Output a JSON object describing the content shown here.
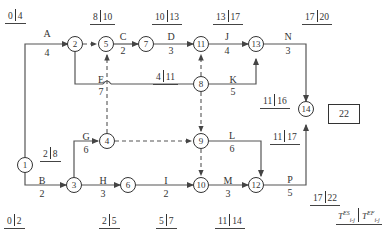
{
  "diagram": {
    "type": "activity-on-arrow network",
    "total_duration": "22",
    "legend": {
      "es": "T",
      "es_sup": "ES",
      "es_sub": "i-j",
      "ef": "T",
      "ef_sup": "EF",
      "ef_sub": "i-j"
    },
    "nodes": [
      "1",
      "2",
      "3",
      "4",
      "5",
      "6",
      "7",
      "8",
      "9",
      "10",
      "11",
      "12",
      "13",
      "14"
    ],
    "activities": [
      {
        "name": "A",
        "duration": "4",
        "from": "1",
        "to": "2",
        "es": "0",
        "ef": "4"
      },
      {
        "name": "B",
        "duration": "2",
        "from": "1",
        "to": "3",
        "es": "0",
        "ef": "2"
      },
      {
        "name": "C",
        "duration": "2",
        "from": "5",
        "to": "7",
        "es": "8",
        "ef": "10"
      },
      {
        "name": "D",
        "duration": "3",
        "from": "7",
        "to": "11",
        "es": "10",
        "ef": "13"
      },
      {
        "name": "E",
        "duration": "7",
        "from": "2",
        "to": "8",
        "es": "4",
        "ef": "11"
      },
      {
        "name": "G",
        "duration": "6",
        "from": "3",
        "to": "4",
        "es": "2",
        "ef": "8"
      },
      {
        "name": "H",
        "duration": "3",
        "from": "3",
        "to": "6",
        "es": "2",
        "ef": "5"
      },
      {
        "name": "I",
        "duration": "2",
        "from": "6",
        "to": "10",
        "es": "5",
        "ef": "7"
      },
      {
        "name": "J",
        "duration": "4",
        "from": "11",
        "to": "13",
        "es": "13",
        "ef": "17"
      },
      {
        "name": "K",
        "duration": "5",
        "from": "8",
        "to": "13",
        "es": "11",
        "ef": "16"
      },
      {
        "name": "L",
        "duration": "6",
        "from": "9",
        "to": "12",
        "es": "11",
        "ef": "17"
      },
      {
        "name": "M",
        "duration": "3",
        "from": "10",
        "to": "12",
        "es": "11",
        "ef": "14"
      },
      {
        "name": "N",
        "duration": "3",
        "from": "13",
        "to": "14",
        "es": "17",
        "ef": "20"
      },
      {
        "name": "P",
        "duration": "5",
        "from": "12",
        "to": "14",
        "es": "17",
        "ef": "22"
      }
    ],
    "dummies": [
      [
        "2",
        "5"
      ],
      [
        "4",
        "5"
      ],
      [
        "8",
        "11"
      ],
      [
        "8",
        "9"
      ],
      [
        "4",
        "9"
      ],
      [
        "9",
        "10"
      ]
    ],
    "time_labels": [
      {
        "es": "0",
        "ef": "4"
      },
      {
        "es": "8",
        "ef": "10"
      },
      {
        "es": "10",
        "ef": "13"
      },
      {
        "es": "13",
        "ef": "17"
      },
      {
        "es": "17",
        "ef": "20"
      },
      {
        "es": "4",
        "ef": "11"
      },
      {
        "es": "11",
        "ef": "16"
      },
      {
        "es": "2",
        "ef": "8"
      },
      {
        "es": "11",
        "ef": "17"
      },
      {
        "es": "17",
        "ef": "22"
      },
      {
        "es": "0",
        "ef": "2"
      },
      {
        "es": "2",
        "ef": "5"
      },
      {
        "es": "5",
        "ef": "7"
      },
      {
        "es": "11",
        "ef": "14"
      }
    ]
  }
}
